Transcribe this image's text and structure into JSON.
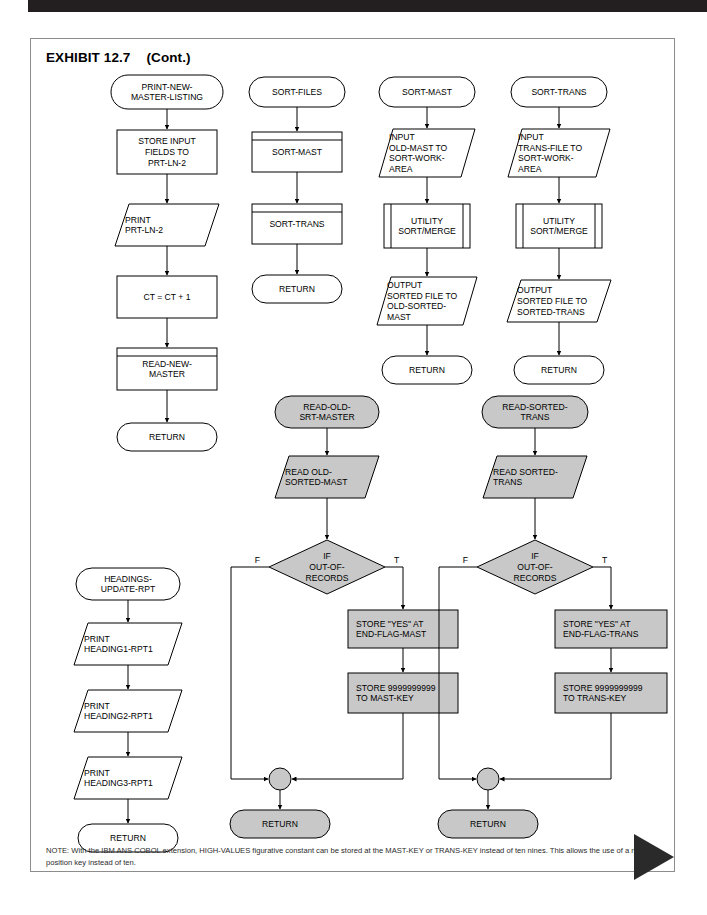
{
  "page": {
    "exhibit_label": "EXHIBIT 12.7",
    "exhibit_cont": "(Cont.)",
    "note": "NOTE:  With the IBM ANS COBOL extension, HIGH-VALUES figurative constant can be stored at the MAST-KEY or TRANS-KEY instead of ten nines. This allows the use of a nine position key instead of ten.",
    "colors": {
      "fill_white": "#ffffff",
      "fill_gray": "#c8c8c8",
      "stroke": "#000000",
      "border": "#8d8d8d",
      "header_bar": "#231f20",
      "triangle": "#2a2a2a"
    }
  },
  "chart_data": {
    "type": "diagram",
    "subcharts": [
      {
        "name": "print-new-master-listing",
        "nodes": [
          {
            "id": "c1n1",
            "shape": "terminator",
            "fill": "white",
            "text": "PRINT-NEW-\nMASTER-LISTING"
          },
          {
            "id": "c1n2",
            "shape": "process",
            "fill": "white",
            "text": "STORE INPUT\nFIELDS TO\nPRT-LN-2"
          },
          {
            "id": "c1n3",
            "shape": "io",
            "fill": "white",
            "text": "PRINT\nPRT-LN-2"
          },
          {
            "id": "c1n4",
            "shape": "process",
            "fill": "white",
            "text": "CT = CT + 1"
          },
          {
            "id": "c1n5",
            "shape": "predefined",
            "fill": "white",
            "text": "READ-NEW-\nMASTER"
          },
          {
            "id": "c1n6",
            "shape": "terminator",
            "fill": "white",
            "text": "RETURN"
          }
        ]
      },
      {
        "name": "sort-files",
        "nodes": [
          {
            "id": "c2n1",
            "shape": "terminator",
            "fill": "white",
            "text": "SORT-FILES"
          },
          {
            "id": "c2n2",
            "shape": "predefined",
            "fill": "white",
            "text": "SORT-MAST"
          },
          {
            "id": "c2n3",
            "shape": "predefined",
            "fill": "white",
            "text": "SORT-TRANS"
          },
          {
            "id": "c2n4",
            "shape": "terminator",
            "fill": "white",
            "text": "RETURN"
          }
        ]
      },
      {
        "name": "sort-mast",
        "nodes": [
          {
            "id": "c3n1",
            "shape": "terminator",
            "fill": "white",
            "text": "SORT-MAST"
          },
          {
            "id": "c3n2",
            "shape": "io",
            "fill": "white",
            "text": "INPUT\nOLD-MAST TO\nSORT-WORK-\nAREA"
          },
          {
            "id": "c3n3",
            "shape": "predefined-vertical",
            "fill": "white",
            "text": "UTILITY\nSORT/MERGE"
          },
          {
            "id": "c3n4",
            "shape": "io",
            "fill": "white",
            "text": "OUTPUT\nSORTED FILE TO\nOLD-SORTED-\nMAST"
          },
          {
            "id": "c3n5",
            "shape": "terminator",
            "fill": "white",
            "text": "RETURN"
          }
        ]
      },
      {
        "name": "sort-trans",
        "nodes": [
          {
            "id": "c4n1",
            "shape": "terminator",
            "fill": "white",
            "text": "SORT-TRANS"
          },
          {
            "id": "c4n2",
            "shape": "io",
            "fill": "white",
            "text": "INPUT\nTRANS-FILE TO\nSORT-WORK-\nAREA"
          },
          {
            "id": "c4n3",
            "shape": "predefined-vertical",
            "fill": "white",
            "text": "UTILITY\nSORT/MERGE"
          },
          {
            "id": "c4n4",
            "shape": "io",
            "fill": "white",
            "text": "OUTPUT\nSORTED FILE TO\nSORTED-TRANS"
          },
          {
            "id": "c4n5",
            "shape": "terminator",
            "fill": "white",
            "text": "RETURN"
          }
        ]
      },
      {
        "name": "read-old-srt-master",
        "nodes": [
          {
            "id": "c5n1",
            "shape": "terminator",
            "fill": "gray",
            "text": "READ-OLD-\nSRT-MASTER"
          },
          {
            "id": "c5n2",
            "shape": "io",
            "fill": "gray",
            "text": "READ OLD-\nSORTED-MAST"
          },
          {
            "id": "c5n3",
            "shape": "decision",
            "fill": "gray",
            "text": "IF\nOUT-OF-\nRECORDS",
            "branch_false": "F",
            "branch_true": "T"
          },
          {
            "id": "c5n4",
            "shape": "process",
            "fill": "gray",
            "text": "STORE \"YES\" AT\nEND-FLAG-MAST"
          },
          {
            "id": "c5n5",
            "shape": "process",
            "fill": "gray",
            "text": "STORE 9999999999\nTO MAST-KEY"
          },
          {
            "id": "c5n6",
            "shape": "connector",
            "fill": "gray",
            "text": ""
          },
          {
            "id": "c5n7",
            "shape": "terminator",
            "fill": "gray",
            "text": "RETURN"
          }
        ]
      },
      {
        "name": "read-sorted-trans",
        "nodes": [
          {
            "id": "c6n1",
            "shape": "terminator",
            "fill": "gray",
            "text": "READ-SORTED-\nTRANS"
          },
          {
            "id": "c6n2",
            "shape": "io",
            "fill": "gray",
            "text": "READ SORTED-\nTRANS"
          },
          {
            "id": "c6n3",
            "shape": "decision",
            "fill": "gray",
            "text": "IF\nOUT-OF-\nRECORDS",
            "branch_false": "F",
            "branch_true": "T"
          },
          {
            "id": "c6n4",
            "shape": "process",
            "fill": "gray",
            "text": "STORE \"YES\" AT\nEND-FLAG-TRANS"
          },
          {
            "id": "c6n5",
            "shape": "process",
            "fill": "gray",
            "text": "STORE 9999999999\nTO TRANS-KEY"
          },
          {
            "id": "c6n6",
            "shape": "connector",
            "fill": "gray",
            "text": ""
          },
          {
            "id": "c6n7",
            "shape": "terminator",
            "fill": "gray",
            "text": "RETURN"
          }
        ]
      },
      {
        "name": "headings-update-rpt",
        "nodes": [
          {
            "id": "c7n1",
            "shape": "terminator",
            "fill": "white",
            "text": "HEADINGS-\nUPDATE-RPT"
          },
          {
            "id": "c7n2",
            "shape": "io",
            "fill": "white",
            "text": "PRINT\nHEADING1-RPT1"
          },
          {
            "id": "c7n3",
            "shape": "io",
            "fill": "white",
            "text": "PRINT\nHEADING2-RPT1"
          },
          {
            "id": "c7n4",
            "shape": "io",
            "fill": "white",
            "text": "PRINT\nHEADING3-RPT1"
          },
          {
            "id": "c7n5",
            "shape": "terminator",
            "fill": "white",
            "text": "RETURN"
          }
        ]
      }
    ]
  },
  "labels": {
    "c1n1": [
      "PRINT-NEW-",
      "MASTER-LISTING"
    ],
    "c1n2": [
      "STORE INPUT",
      "FIELDS TO",
      "PRT-LN-2"
    ],
    "c1n3": [
      "PRINT",
      "PRT-LN-2"
    ],
    "c1n4": [
      "CT = CT + 1"
    ],
    "c1n5": [
      "READ-NEW-",
      "MASTER"
    ],
    "c1n6": [
      "RETURN"
    ],
    "c2n1": [
      "SORT-FILES"
    ],
    "c2n2": [
      "SORT-MAST"
    ],
    "c2n3": [
      "SORT-TRANS"
    ],
    "c2n4": [
      "RETURN"
    ],
    "c3n1": [
      "SORT-MAST"
    ],
    "c3n2": [
      "INPUT",
      "OLD-MAST TO",
      "SORT-WORK-",
      "AREA"
    ],
    "c3n3": [
      "UTILITY",
      "SORT/MERGE"
    ],
    "c3n4": [
      "OUTPUT",
      "SORTED FILE TO",
      "OLD-SORTED-",
      "MAST"
    ],
    "c3n5": [
      "RETURN"
    ],
    "c4n1": [
      "SORT-TRANS"
    ],
    "c4n2": [
      "INPUT",
      "TRANS-FILE TO",
      "SORT-WORK-",
      "AREA"
    ],
    "c4n3": [
      "UTILITY",
      "SORT/MERGE"
    ],
    "c4n4": [
      "OUTPUT",
      "SORTED FILE TO",
      "SORTED-TRANS"
    ],
    "c4n5": [
      "RETURN"
    ],
    "c5n1": [
      "READ-OLD-",
      "SRT-MASTER"
    ],
    "c5n2": [
      "READ OLD-",
      "SORTED-MAST"
    ],
    "c5n3": [
      "IF",
      "OUT-OF-",
      "RECORDS"
    ],
    "c5n4": [
      "STORE \"YES\" AT",
      "END-FLAG-MAST"
    ],
    "c5n5": [
      "STORE 9999999999",
      "TO MAST-KEY"
    ],
    "c5n7": [
      "RETURN"
    ],
    "c6n1": [
      "READ-SORTED-",
      "TRANS"
    ],
    "c6n2": [
      "READ SORTED-",
      "TRANS"
    ],
    "c6n3": [
      "IF",
      "OUT-OF-",
      "RECORDS"
    ],
    "c6n4": [
      "STORE \"YES\" AT",
      "END-FLAG-TRANS"
    ],
    "c6n5": [
      "STORE 9999999999",
      "TO TRANS-KEY"
    ],
    "c6n7": [
      "RETURN"
    ],
    "c7n1": [
      "HEADINGS-",
      "UPDATE-RPT"
    ],
    "c7n2": [
      "PRINT",
      "HEADING1-RPT1"
    ],
    "c7n3": [
      "PRINT",
      "HEADING2-RPT1"
    ],
    "c7n4": [
      "PRINT",
      "HEADING3-RPT1"
    ],
    "c7n5": [
      "RETURN"
    ],
    "branch_F": "F",
    "branch_T": "T"
  }
}
